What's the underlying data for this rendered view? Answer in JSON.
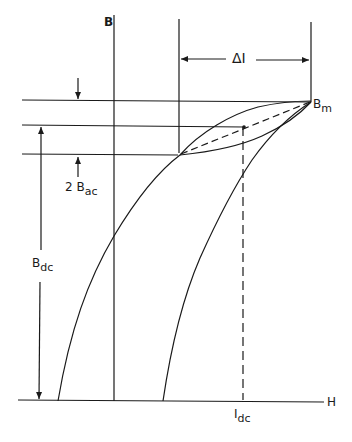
{
  "diagram": {
    "type": "B-H magnetization curve with minor hysteresis loop",
    "axes": {
      "y_label": "B",
      "x_label": "H"
    },
    "labels": {
      "delta_i": "ΔI",
      "b_m": {
        "main": "B",
        "sub": "m"
      },
      "two_b_ac": {
        "main": "2 B",
        "sub": "ac"
      },
      "b_dc": {
        "main": "B",
        "sub": "dc"
      },
      "i_dc": {
        "main": "I",
        "sub": "dc"
      }
    },
    "colors": {
      "line": "#1a1a1a",
      "background": "#ffffff"
    }
  }
}
